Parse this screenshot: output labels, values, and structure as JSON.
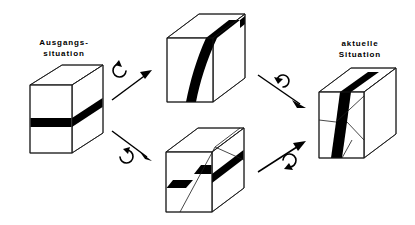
{
  "diagram": {
    "background_color": "#ffffff",
    "line_color": "#1a1a1a",
    "band_color": "#000000",
    "labels": {
      "start": "Ausgangs-\nsituation",
      "current": "aktuelle\nSituation"
    },
    "blocks": [
      {
        "id": "initial",
        "name": "ausgangssituation-cube",
        "description": "Wuerfel mit horizontalem schwarzem Band",
        "band_orientation": "horizontal",
        "faulted": false
      },
      {
        "id": "rotated",
        "name": "rotated-cube",
        "description": "Wuerfel mit steil stehendem, gebogenem schwarzem Band",
        "band_orientation": "steil / vertikal",
        "faulted": false
      },
      {
        "id": "faulted",
        "name": "faulted-cube",
        "description": "Wuerfel mit horizontalem Band, versetzt an einer schraegen Stoerung",
        "band_orientation": "horizontal versetzt",
        "faulted": true
      },
      {
        "id": "current",
        "name": "aktuelle-situation-cube",
        "description": "Wuerfel mit steilem, an einer Stoerung versetztem schwarzem Band",
        "band_orientation": "steil versetzt",
        "faulted": true
      }
    ],
    "arrows": [
      {
        "id": "arrow-upper-left",
        "name": "arrow-initial-to-rotated",
        "from": "initial",
        "to": "rotated",
        "direction": "up-right",
        "glyph": "rotation-icon"
      },
      {
        "id": "arrow-lower-left",
        "name": "arrow-initial-to-faulted",
        "from": "initial",
        "to": "faulted",
        "direction": "down-right",
        "glyph": "rotation-icon"
      },
      {
        "id": "arrow-upper-right",
        "name": "arrow-rotated-to-current",
        "from": "rotated",
        "to": "current",
        "direction": "down-right",
        "glyph": "rotation-icon"
      },
      {
        "id": "arrow-lower-right",
        "name": "arrow-faulted-to-current",
        "from": "faulted",
        "to": "current",
        "direction": "up-right",
        "glyph": "rotation-icon"
      }
    ]
  }
}
